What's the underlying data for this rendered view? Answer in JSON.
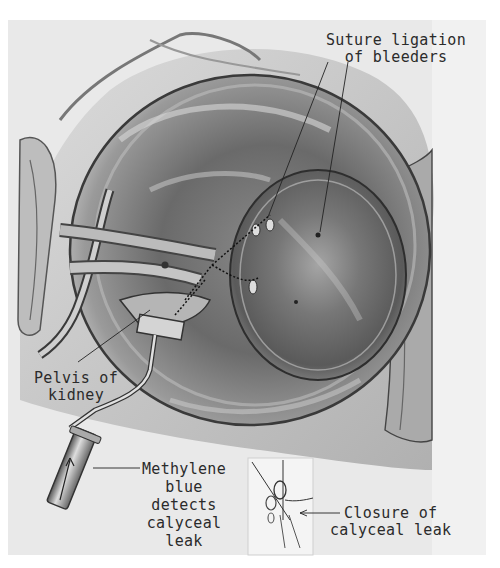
{
  "illustration": {
    "subject": "surgical illustration of kidney with suture ligation and methylene blue calyceal leak detection",
    "background_color": "#ffffff",
    "paper_color": "#ececec",
    "side_strip_color": "#f2f2f2"
  },
  "labels": {
    "suture_ligation": {
      "line1": "Suture ligation",
      "line2": "of bleeders"
    },
    "pelvis": {
      "line1": "Pelvis of",
      "line2": "kidney"
    },
    "methylene": {
      "line1": "Methylene",
      "line2": "blue",
      "line3": "detects",
      "line4": "calyceal",
      "line5": "leak"
    },
    "closure": {
      "line1": "Closure of",
      "line2": "calyceal leak"
    }
  },
  "inset": {
    "description": "inset showing closure of calyceal leak with suture"
  }
}
